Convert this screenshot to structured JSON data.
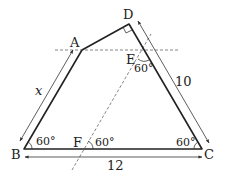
{
  "diagram": {
    "type": "geometry-figure",
    "points": {
      "A": {
        "label": "A"
      },
      "B": {
        "label": "B"
      },
      "C": {
        "label": "C"
      },
      "D": {
        "label": "D"
      },
      "E": {
        "label": "E"
      },
      "F": {
        "label": "F"
      }
    },
    "angles": {
      "B": "60°",
      "C": "60°",
      "F": "60°",
      "E": "60°",
      "D": "right-angle"
    },
    "lengths": {
      "AB": "x",
      "DC": "10",
      "BC": "12"
    },
    "colors": {
      "stroke": "#222222",
      "dashed": "#666666",
      "background": "#ffffff"
    }
  }
}
